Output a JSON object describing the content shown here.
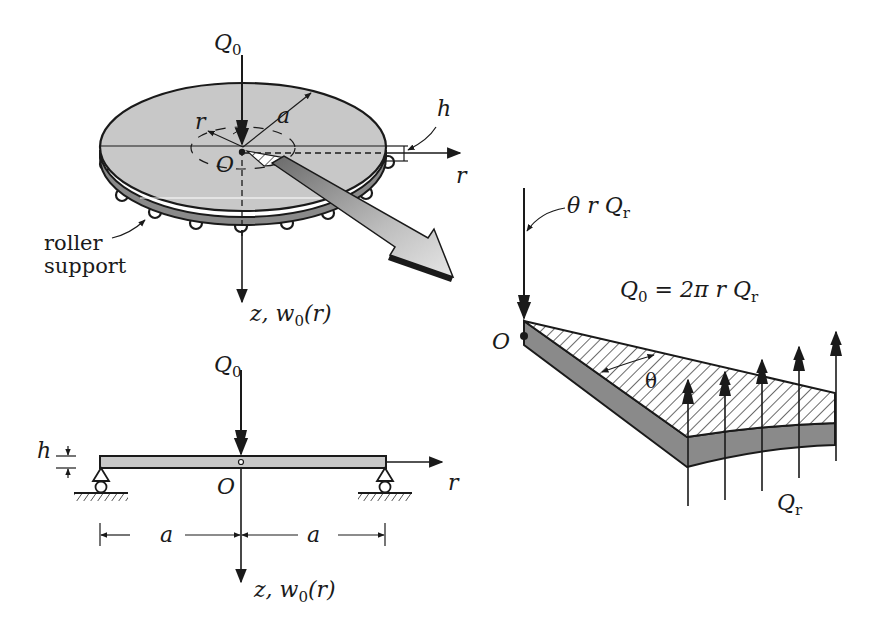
{
  "figure": {
    "panels": [
      {
        "id": "plate-3d",
        "description": "Circular plate of radius a and thickness h on roller support with central point load Q0",
        "labels": {
          "load": "Q",
          "load_sub": "0",
          "radius": "a",
          "thickness": "h",
          "radial_coord_left": "r",
          "radial_axis": "r",
          "origin": "O",
          "vertical_axis": "z, w",
          "vertical_axis_sub": "0",
          "vertical_axis_arg": "(r)",
          "support_line1": "roller",
          "support_line2": "support"
        }
      },
      {
        "id": "cross-section",
        "description": "Cross-section of simply supported plate with central load",
        "labels": {
          "load": "Q",
          "load_sub": "0",
          "thickness": "h",
          "origin": "O",
          "radial_axis": "r",
          "span_left": "a",
          "span_right": "a",
          "vertical_axis": "z, w",
          "vertical_axis_sub": "0",
          "vertical_axis_arg": "(r)"
        }
      },
      {
        "id": "sector-detail",
        "description": "Free body of a plate sector with shear forces Qr along the edge",
        "labels": {
          "applied_load": "θ r Q",
          "applied_load_sub": "r",
          "equation_lhs": "Q",
          "equation_lhs_sub": "0",
          "equation_rhs": " = 2π r Q",
          "equation_rhs_sub": "r",
          "origin": "O",
          "angle": "θ",
          "edge_force": "Q",
          "edge_force_sub": "r"
        }
      }
    ],
    "colors": {
      "plate_top": "#c8c8c8",
      "plate_edge": "#8a8a8a",
      "ink": "#1a1a1a",
      "background": "#ffffff"
    }
  }
}
